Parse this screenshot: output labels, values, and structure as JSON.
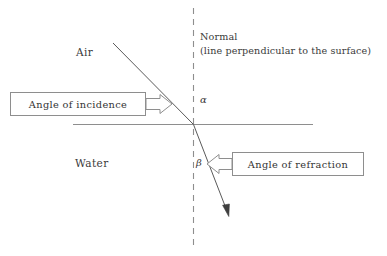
{
  "diagram": {
    "media": {
      "upper_label": "Air",
      "lower_label": "Water"
    },
    "normal": {
      "label": "Normal",
      "description": "(line perpendicular to the surface)",
      "style": "dashed"
    },
    "angles": {
      "incidence_symbol": "α",
      "refraction_symbol": "β"
    },
    "callouts": {
      "incidence_label": "Angle of incidence",
      "refraction_label": "Angle of refraction"
    },
    "colors": {
      "stroke": "#8e8e8e",
      "ray": "#5a5a5a",
      "text": "#3a3a3a",
      "background": "#ffffff"
    },
    "icons": {
      "incidence_pointer": "block-arrow-right-icon",
      "refraction_pointer": "block-arrow-left-icon",
      "ray_head": "arrowhead-icon"
    }
  }
}
